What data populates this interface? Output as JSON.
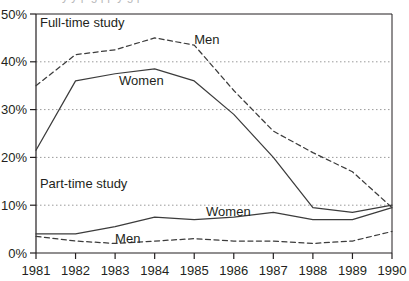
{
  "chart_data": {
    "type": "line",
    "title": "",
    "xlabel": "",
    "ylabel": "",
    "x": [
      1981,
      1982,
      1983,
      1984,
      1985,
      1986,
      1987,
      1988,
      1989,
      1990
    ],
    "categories": [
      "1981",
      "1982",
      "1983",
      "1984",
      "1985",
      "1986",
      "1987",
      "1988",
      "1989",
      "1990"
    ],
    "ylim": [
      0,
      50
    ],
    "xlim": [
      1981,
      1990
    ],
    "ytick_labels": [
      "0%",
      "10%",
      "20%",
      "30%",
      "40%",
      "50%"
    ],
    "ytick_values": [
      0,
      10,
      20,
      30,
      40,
      50
    ],
    "grid": "horizontal-dotted",
    "legend_position": "inline-annotations",
    "groups": [
      {
        "name": "Full-time study",
        "label": "Full-time study",
        "series": [
          {
            "name": "Men",
            "label": "Men",
            "style": "dashed",
            "values": [
              35,
              41.5,
              42.5,
              45,
              43.5,
              34,
              25.5,
              21,
              17,
              9.5
            ]
          },
          {
            "name": "Women",
            "label": "Women",
            "style": "solid",
            "values": [
              21.5,
              36,
              37.5,
              38.5,
              36,
              29,
              20,
              9.5,
              8.5,
              10
            ]
          }
        ]
      },
      {
        "name": "Part-time study",
        "label": "Part-time study",
        "series": [
          {
            "name": "Women",
            "label": "Women",
            "style": "solid",
            "values": [
              4,
              4,
              5.5,
              7.5,
              7,
              7.5,
              8.5,
              7,
              7,
              9.5
            ]
          },
          {
            "name": "Men",
            "label": "Men",
            "style": "dashed",
            "values": [
              3.5,
              2.5,
              2,
              2.5,
              3,
              2.5,
              2.5,
              2,
              2.5,
              4.5
            ]
          }
        ]
      }
    ],
    "annotations": [
      {
        "text": "Full-time study",
        "x": 1981.1,
        "y": 48.3
      },
      {
        "text": "Men",
        "x": 1985.0,
        "y": 44.6
      },
      {
        "text": "Women",
        "x": 1983.1,
        "y": 36.0
      },
      {
        "text": "Part-time study",
        "x": 1981.1,
        "y": 14.6
      },
      {
        "text": "Women",
        "x": 1985.3,
        "y": 8.6
      },
      {
        "text": "Men",
        "x": 1983.0,
        "y": 3.0
      }
    ],
    "colors": {
      "line": "#3c3c3c",
      "axis": "#231f20",
      "grid": "#9a9a9a",
      "text": "#231f20",
      "background": "#ffffff"
    }
  }
}
